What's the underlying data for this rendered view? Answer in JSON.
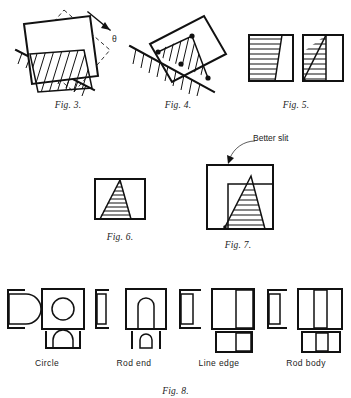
{
  "document": {
    "kind": "technical-figure-plate",
    "background_color": "#ffffff",
    "ink_color": "#111111"
  },
  "row_top": {
    "figures": [
      {
        "id": "fig3",
        "caption": "Fig. 3.",
        "angle_symbol": "θ",
        "description": "rotated square aperture over hatched half-plane with dashed outline showing rotation by theta"
      },
      {
        "id": "fig4",
        "caption": "Fig. 4.",
        "description": "tilted rectangle crossing a hatched edge, three marked intersection points"
      },
      {
        "id": "fig5",
        "caption": "Fig. 5.",
        "description": "two square apertures with horizontally hatched regions bounded by slanted lines"
      }
    ]
  },
  "row_middle": {
    "annotation": "Better slit",
    "figures": [
      {
        "id": "fig6",
        "caption": "Fig. 6.",
        "description": "small square with narrow hatched trapezoid slit"
      },
      {
        "id": "fig7",
        "caption": "Fig. 7.",
        "description": "large square with inner square and hatched triangular slit"
      }
    ]
  },
  "row_bottom": {
    "caption": "Fig. 8.",
    "groups": [
      {
        "id": "circle",
        "label": "Circle"
      },
      {
        "id": "rod-end",
        "label": "Rod end"
      },
      {
        "id": "line-edge",
        "label": "Line edge"
      },
      {
        "id": "rod-body",
        "label": "Rod body"
      }
    ]
  }
}
